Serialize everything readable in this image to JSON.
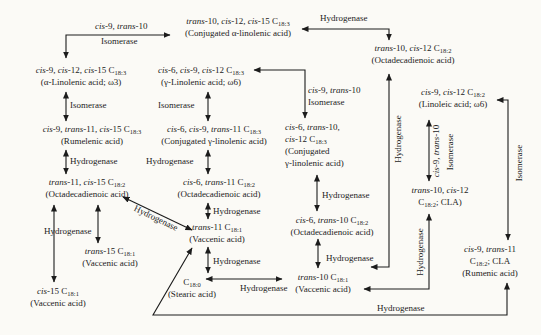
{
  "figure": {
    "type": "biochemical-pathway-diagram",
    "colors": {
      "ink": "#1c1c1c",
      "paper": "#fbfaf6"
    },
    "nodes": {
      "conjugated_alpha_linolenic": {
        "lines": [
          "trans-10, cis-12, cis-15 C18:3",
          "(Conjugated α-linolenic acid)"
        ]
      },
      "alpha_linolenic": {
        "lines": [
          "cis-9, cis-12, cis-15 C18:3",
          "(α-Linolenic acid; ω3)"
        ]
      },
      "gamma_linolenic": {
        "lines": [
          "cis-6, cis-9, cis-12 C18:3",
          "(γ-Linolenic acid; ω6)"
        ]
      },
      "t10_c12_octadecadienoic": {
        "lines": [
          "trans-10, cis-12 C18:2",
          "(Octadecadienoic acid)"
        ]
      },
      "linoleic": {
        "lines": [
          "cis-9, cis-12 C18:2",
          "(Linoleic acid; ω6)"
        ]
      },
      "rumelenic": {
        "lines": [
          "cis-9, trans-11, cis-15 C18:3",
          "(Rumelenic acid)"
        ]
      },
      "conjugated_gamma_t11": {
        "lines": [
          "cis-6, cis-9, trans-11 C18:3",
          "(Conjugated γ-linolenic acid)"
        ]
      },
      "conjugated_gamma_t10": {
        "lines": [
          "cis-6, trans-10,",
          "cis-12 C18:3",
          "(Conjugated",
          "γ-linolenic acid)"
        ]
      },
      "t11_c15_octadecadienoic": {
        "lines": [
          "trans-11, cis-15 C18:2",
          "(Octadecadienoic acid)"
        ]
      },
      "c6_t11_octadecadienoic": {
        "lines": [
          "cis-6, trans-11 C18:2",
          "(Octadecadienoic acid)"
        ]
      },
      "t10_c12_cla": {
        "lines": [
          "trans-10, cis-12",
          "C18:2; CLA)"
        ]
      },
      "c6_t10_octadecadienoic": {
        "lines": [
          "cis-6, trans-10 C18:2",
          "(Octadecadienoic acid)"
        ]
      },
      "t11_vaccenic": {
        "lines": [
          "trans-11 C18:1",
          "(Vaccenic acid)"
        ]
      },
      "rumenic": {
        "lines": [
          "cis-9, trans-11",
          "C18:2; CLA",
          "(Rumenic acid)"
        ]
      },
      "t15_vaccenic": {
        "lines": [
          "trans-15 C18:1",
          "(Vaccenic acid)"
        ]
      },
      "c15_vaccenic": {
        "lines": [
          "cis-15 C18:1",
          "(Vaccenic acid)"
        ]
      },
      "stearic": {
        "lines": [
          "C18:0",
          "(Stearic acid)"
        ]
      },
      "t10_vaccenic": {
        "lines": [
          "trans-10 C18:1",
          "(Vaccenic acid)"
        ]
      }
    },
    "labels": {
      "top_left_line1": "cis-9, trans-10",
      "top_left_line2": "Isomerase",
      "top_hydrogenase": "Hydrogenase",
      "left_isomerase": "Isomerase",
      "left_hydrogenase_1": "Hydrogenase",
      "left_hydrogenase_2": "Hydrogenase",
      "mid_isomerase": "Isomerase",
      "mid_hydrogenase_1": "Hydrogenase",
      "mid_hydrogenase_2": "Hydrogenase",
      "mid_hydrogenase_3": "Hydrogenase",
      "diag_hydrogenase": "Hydrogenase",
      "c13_line1": "cis-9, trans-10",
      "c13_line2": "Isomerase",
      "c14_hydrogenase": "Hydrogenase",
      "c15_hydrogenase": "Hydrogenase",
      "stearic_hydrogenase": "Hydrogenase",
      "vert_hydrogenase_left": "Hydrogenase",
      "vert_isomerase_line1": "cis-9, trans-10",
      "vert_isomerase_line2": "Isomerase",
      "vert_hydrogenase_right": "Hydrogenase",
      "far_right_isomerase": "Isomerase",
      "bottom_hydrogenase": "Hydrogenase"
    }
  }
}
